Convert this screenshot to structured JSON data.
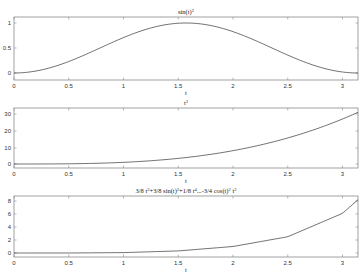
{
  "chart_data": [
    {
      "type": "line",
      "title": "sin(t)^2",
      "title_main": "sin(t)",
      "title_sup": "2",
      "xlabel": "t",
      "ylabel": "",
      "xlim": [
        0,
        3.1416
      ],
      "ylim": [
        -0.05,
        1.05
      ],
      "xticks": [
        "0",
        "0.5",
        "1",
        "1.5",
        "2",
        "2.5",
        "3"
      ],
      "yticks": [
        "0",
        "0.5",
        "1"
      ],
      "grid": false,
      "x": [
        0,
        0.25,
        0.5,
        0.75,
        1.0,
        1.25,
        1.5,
        1.5708,
        1.75,
        2.0,
        2.25,
        2.5,
        2.75,
        3.0,
        3.1416
      ],
      "values": [
        0,
        0.061,
        0.23,
        0.465,
        0.708,
        0.9,
        0.995,
        1.0,
        0.968,
        0.827,
        0.604,
        0.358,
        0.146,
        0.02,
        0
      ],
      "color": "#333333"
    },
    {
      "type": "line",
      "title": "t^3",
      "title_main": "t",
      "title_sup": "3",
      "xlabel": "t",
      "ylabel": "",
      "xlim": [
        0,
        3.1416
      ],
      "ylim": [
        -2,
        33
      ],
      "xticks": [
        "0",
        "0.5",
        "1",
        "1.5",
        "2",
        "2.5",
        "3"
      ],
      "yticks": [
        "0",
        "10",
        "20",
        "30"
      ],
      "grid": false,
      "x": [
        0,
        0.5,
        1.0,
        1.5,
        2.0,
        2.5,
        3.0,
        3.1416
      ],
      "values": [
        0,
        0.125,
        1,
        3.375,
        8,
        15.625,
        27,
        31.0
      ],
      "color": "#333333"
    },
    {
      "type": "line",
      "title": "3/8 t^2+3/8 sin(t)^2+1/8 t^4...-3/4 cos(t)^2 t^2",
      "title_parts": [
        "3/8 t",
        "2",
        "+3/8 sin(t)",
        "2",
        "+1/8 t",
        "4",
        "...-3/4 cos(t)",
        "2",
        " t",
        "2"
      ],
      "xlabel": "t",
      "ylabel": "",
      "xlim": [
        0,
        3.1416
      ],
      "ylim": [
        -0.5,
        8.7
      ],
      "xticks": [
        "0",
        "0.5",
        "1",
        "1.5",
        "2",
        "2.5",
        "3"
      ],
      "yticks": [
        "0",
        "2",
        "4",
        "6",
        "8"
      ],
      "grid": false,
      "x": [
        0,
        0.5,
        1.0,
        1.5,
        2.0,
        2.5,
        3.0,
        3.1416
      ],
      "values": [
        0,
        0.002,
        0.06,
        0.32,
        1.0,
        2.5,
        6.1,
        8.2
      ],
      "color": "#333333"
    }
  ]
}
